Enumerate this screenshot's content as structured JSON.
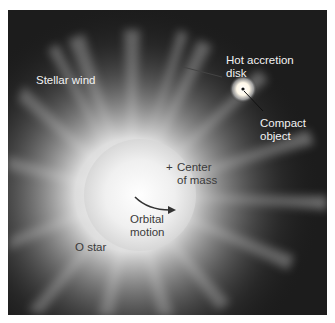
{
  "figure": {
    "labels": {
      "stellar_wind": "Stellar wind",
      "hot_accretion_disk_line1": "Hot accretion",
      "hot_accretion_disk_line2": "disk",
      "compact_object_line1": "Compact",
      "compact_object_line2": "object",
      "center_of_mass_marker": "+",
      "center_of_mass_line1": "Center",
      "center_of_mass_line2": "of mass",
      "orbital_motion_line1": "Orbital",
      "orbital_motion_line2": "motion",
      "o_star": "O star"
    },
    "colors": {
      "background": "#1c1c1c",
      "star_glow": "#ffffff",
      "label_light": "#f2f2f2",
      "label_dark": "#3a3a3a"
    }
  }
}
